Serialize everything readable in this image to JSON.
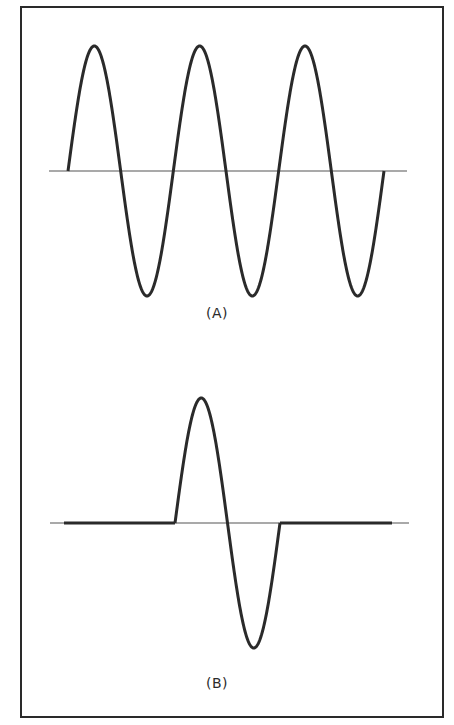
{
  "figure": {
    "panels": [
      {
        "id": "A",
        "label": "(A)",
        "description": "Continuous sine wave, three full cycles",
        "cycles": 3,
        "axis_y": 171,
        "axis_x_range": [
          49,
          407
        ],
        "wave_start_x": 68,
        "wave_end_x": 384,
        "period_px": 105.3,
        "amplitude_px": 125
      },
      {
        "id": "B",
        "label": "(B)",
        "description": "Single cycle sine burst with flat line before and after",
        "cycles": 1,
        "axis_y": 523,
        "axis_x_range": [
          50,
          409
        ],
        "flat_before_x": [
          64,
          175
        ],
        "wave_start_x": 175,
        "wave_end_x": 280,
        "flat_after_x": [
          280,
          392
        ],
        "amplitude_px": 125
      }
    ],
    "colors": {
      "stroke": "#2a2a2a",
      "axis": "#555555",
      "background": "#ffffff"
    }
  }
}
